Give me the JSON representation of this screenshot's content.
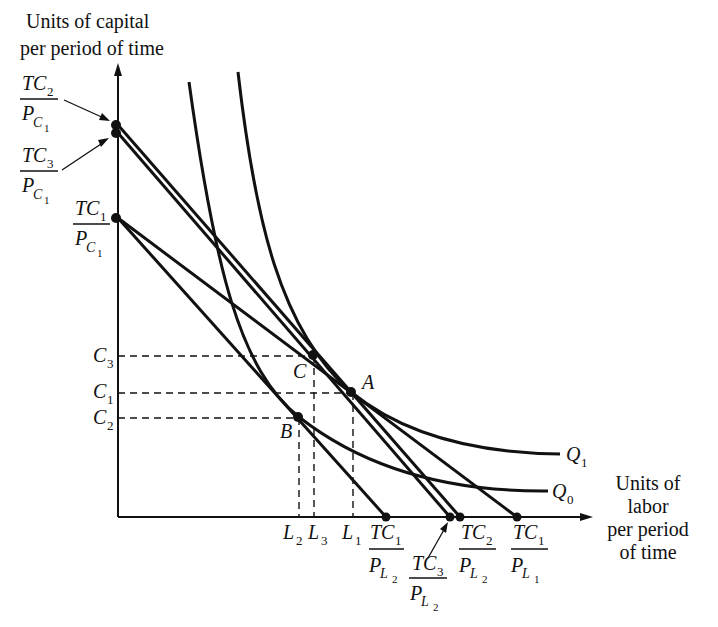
{
  "diagram": {
    "type": "isoquant-isocost",
    "y_axis_title": [
      "Units of  capital",
      "per period of time"
    ],
    "x_axis_title": [
      "Units of",
      "labor",
      "per period",
      "of time"
    ],
    "curves": [
      {
        "id": "Q1",
        "label": "Q",
        "sub": "1"
      },
      {
        "id": "Q0",
        "label": "Q",
        "sub": "0"
      }
    ],
    "points": [
      {
        "id": "A",
        "label": "A"
      },
      {
        "id": "B",
        "label": "B"
      },
      {
        "id": "C",
        "label": "C"
      }
    ],
    "y_ticks": [
      {
        "label": "C",
        "sub": "3"
      },
      {
        "label": "C",
        "sub": "1"
      },
      {
        "label": "C",
        "sub": "2"
      }
    ],
    "x_ticks": [
      {
        "label": "L",
        "sub": "2"
      },
      {
        "label": "L",
        "sub": "3"
      },
      {
        "label": "L",
        "sub": "1"
      }
    ],
    "y_intercepts": [
      {
        "num": "TC",
        "num_sub": "2",
        "den": "P",
        "den_sub_a": "C",
        "den_sub_b": "1"
      },
      {
        "num": "TC",
        "num_sub": "3",
        "den": "P",
        "den_sub_a": "C",
        "den_sub_b": "1"
      },
      {
        "num": "TC",
        "num_sub": "1",
        "den": "P",
        "den_sub_a": "C",
        "den_sub_b": "1"
      }
    ],
    "x_intercepts": [
      {
        "num": "TC",
        "num_sub": "1",
        "den": "P",
        "den_sub_a": "L",
        "den_sub_b": "2"
      },
      {
        "num": "TC",
        "num_sub": "3",
        "den": "P",
        "den_sub_a": "L",
        "den_sub_b": "2"
      },
      {
        "num": "TC",
        "num_sub": "2",
        "den": "P",
        "den_sub_a": "L",
        "den_sub_b": "2"
      },
      {
        "num": "TC",
        "num_sub": "1",
        "den": "P",
        "den_sub_a": "L",
        "den_sub_b": "1"
      }
    ],
    "isocost_lines": [
      {
        "from": "TC1/PC1",
        "to": "TC1/PL1",
        "tangent_at": "A"
      },
      {
        "from": "TC1/PC1",
        "to": "TC1/PL2",
        "tangent_at": "B"
      },
      {
        "from": "TC2/PC1",
        "to": "TC2/PL2"
      },
      {
        "from": "TC3/PC1",
        "to": "TC3/PL2",
        "tangent_at": "C"
      }
    ]
  }
}
